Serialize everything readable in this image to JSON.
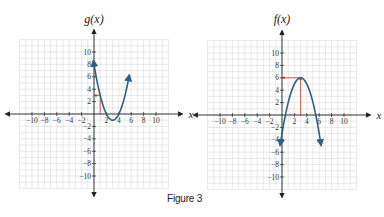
{
  "figure": {
    "caption": "Figure 3"
  },
  "colors": {
    "grid": "#d9d9d9",
    "axis": "#222222",
    "curve": "#2e5f84",
    "annotation": "#c0392b",
    "text": "#333333"
  },
  "chart_data": [
    {
      "type": "line",
      "title": "g(x)",
      "xlabel": "x",
      "ylabel": "g(x)",
      "xlim": [
        -12,
        12
      ],
      "ylim": [
        -12,
        12
      ],
      "grid": true,
      "x_ticks": [
        -10,
        -8,
        -6,
        -4,
        -2,
        2,
        4,
        6,
        8,
        10
      ],
      "y_ticks": [
        -10,
        -8,
        -6,
        -4,
        -2,
        2,
        4,
        6,
        8,
        10
      ],
      "x_tick_labels": [
        "−10",
        "−8",
        "−6",
        "−4",
        "−2",
        "2",
        "4",
        "6",
        "8",
        "10"
      ],
      "y_tick_labels": [
        "−10",
        "−8",
        "−6",
        "−4",
        "−2",
        "2",
        "4",
        "6",
        "8",
        "10"
      ],
      "curve": {
        "formula": "(x-3)^2 - 1",
        "a": 1,
        "h": 3,
        "k": -1,
        "x_range": [
          -0.1,
          5.7
        ],
        "arrows": "both"
      },
      "vertex": [
        3,
        -1
      ],
      "annotations": [
        {
          "type": "vertical",
          "from": [
            1,
            0
          ],
          "to": [
            1,
            3
          ]
        },
        {
          "type": "horizontal-arrow",
          "from": [
            1,
            3
          ],
          "to": [
            0,
            3
          ]
        }
      ],
      "pixel": {
        "ox": 94,
        "oy": 114,
        "unit": 6.2
      }
    },
    {
      "type": "line",
      "title": "f(x)",
      "xlabel": "x",
      "ylabel": "f(x)",
      "xlim": [
        -12,
        12
      ],
      "ylim": [
        -12,
        12
      ],
      "grid": true,
      "x_ticks": [
        -10,
        -8,
        -6,
        -4,
        -2,
        2,
        4,
        6,
        8,
        10
      ],
      "y_ticks": [
        -10,
        -8,
        -6,
        -4,
        -2,
        2,
        4,
        6,
        8,
        10
      ],
      "x_tick_labels": [
        "−10",
        "−8",
        "−6",
        "−4",
        "−2",
        "2",
        "4",
        "6",
        "8",
        "10"
      ],
      "y_tick_labels": [
        "−10",
        "−8",
        "−6",
        "−4",
        "−2",
        "2",
        "4",
        "6",
        "8",
        "10"
      ],
      "curve": {
        "formula": "-(x-3)^2 + 6",
        "a": -1,
        "h": 3,
        "k": 6,
        "x_range": [
          -0.3,
          6.3
        ],
        "arrows": "both"
      },
      "vertex": [
        3,
        6
      ],
      "annotations": [
        {
          "type": "vertical-arrow",
          "from": [
            3,
            0
          ],
          "to": [
            3,
            6
          ]
        },
        {
          "type": "horizontal-arrow",
          "from": [
            3,
            6
          ],
          "to": [
            0,
            6
          ]
        }
      ],
      "pixel": {
        "ox": 282,
        "oy": 115,
        "unit": 6.2
      }
    }
  ]
}
